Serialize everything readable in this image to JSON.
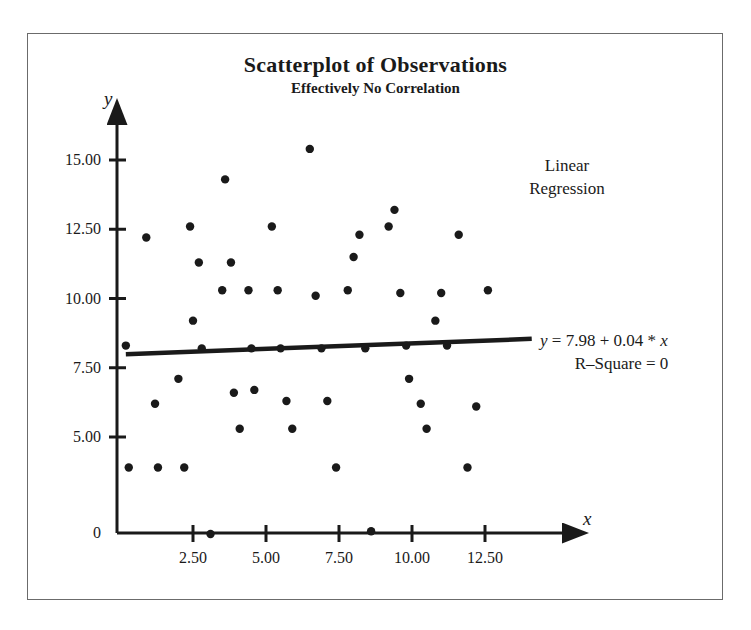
{
  "figure": {
    "title": "Scatterplot of Observations",
    "subtitle": "Effectively No Correlation",
    "annotation_line1": "Linear",
    "annotation_line2": "Regression",
    "equation": "y = 7.98 + 0.04 * x",
    "equation_y": "y",
    "equation_rest": " = 7.98 + 0.04 * ",
    "equation_x": "x",
    "r_square": "R–Square = 0",
    "point_color": "#1a1a1a",
    "line_color": "#1a1a1a",
    "frame_color": "#6b6b6b",
    "background": "#ffffff"
  },
  "chart_data": {
    "type": "scatter",
    "title": "Scatterplot of Observations",
    "subtitle": "Effectively No Correlation",
    "xlabel": "x",
    "ylabel": "y",
    "grid": false,
    "legend": null,
    "xlim": [
      0,
      14.5
    ],
    "ylim": [
      0,
      16.0
    ],
    "xticks": [
      2.5,
      5.0,
      7.5,
      10.0,
      12.5
    ],
    "xticklabels": [
      "2.50",
      "5.00",
      "7.50",
      "10.00",
      "12.50"
    ],
    "yticks": [
      0,
      5.0,
      7.5,
      10.0,
      12.5,
      15.0
    ],
    "yticklabels": [
      "0",
      "5.00",
      "7.50",
      "10.00",
      "12.50",
      "15.00"
    ],
    "points": [
      [
        0.2,
        8.3
      ],
      [
        0.3,
        3.9
      ],
      [
        0.9,
        12.2
      ],
      [
        1.2,
        6.2
      ],
      [
        1.3,
        3.9
      ],
      [
        2.0,
        7.1
      ],
      [
        2.2,
        3.9
      ],
      [
        2.4,
        12.6
      ],
      [
        2.5,
        9.2
      ],
      [
        2.7,
        11.3
      ],
      [
        2.8,
        8.2
      ],
      [
        3.1,
        1.5
      ],
      [
        3.5,
        10.3
      ],
      [
        3.6,
        14.3
      ],
      [
        3.8,
        11.3
      ],
      [
        3.9,
        6.6
      ],
      [
        4.1,
        5.3
      ],
      [
        4.4,
        10.3
      ],
      [
        4.5,
        8.2
      ],
      [
        4.6,
        6.7
      ],
      [
        5.2,
        12.6
      ],
      [
        5.4,
        10.3
      ],
      [
        5.5,
        8.2
      ],
      [
        5.7,
        6.3
      ],
      [
        5.9,
        5.3
      ],
      [
        6.5,
        15.4
      ],
      [
        6.7,
        10.1
      ],
      [
        6.9,
        8.2
      ],
      [
        7.1,
        6.3
      ],
      [
        7.4,
        3.9
      ],
      [
        7.8,
        10.3
      ],
      [
        8.0,
        11.5
      ],
      [
        8.2,
        12.3
      ],
      [
        8.4,
        8.2
      ],
      [
        8.6,
        1.6
      ],
      [
        9.2,
        12.6
      ],
      [
        9.4,
        13.2
      ],
      [
        9.6,
        10.2
      ],
      [
        9.8,
        8.3
      ],
      [
        9.9,
        7.1
      ],
      [
        10.3,
        6.2
      ],
      [
        10.5,
        5.3
      ],
      [
        10.8,
        9.2
      ],
      [
        11.0,
        10.2
      ],
      [
        11.2,
        8.3
      ],
      [
        11.6,
        12.3
      ],
      [
        11.9,
        3.9
      ],
      [
        12.2,
        6.1
      ],
      [
        12.6,
        10.3
      ]
    ],
    "regression": {
      "label": "Linear Regression",
      "equation": "y = 7.98 + 0.04 * x",
      "intercept": 7.98,
      "slope": 0.04,
      "r_square": 0,
      "x_start": 0.2,
      "x_end": 14.1
    }
  }
}
